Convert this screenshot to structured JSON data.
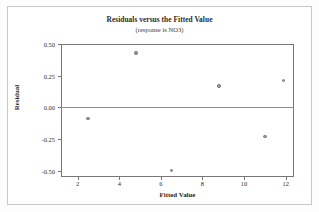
{
  "chart_data": {
    "type": "scatter",
    "title": "Residuals versus the Fitted Value",
    "subtitle": "(response is NO3)",
    "xlabel": "Fitted Value",
    "ylabel": "Residual",
    "xlim": [
      1.2,
      12.4
    ],
    "ylim": [
      -0.55,
      0.5
    ],
    "grid": false,
    "legend": null,
    "reference_line": {
      "axis": "y",
      "value": 0.0,
      "label": "zero-residual-line"
    },
    "x_ticks": [
      {
        "value": 2,
        "label": "2"
      },
      {
        "value": 4,
        "label": "4"
      },
      {
        "value": 6,
        "label": "6"
      },
      {
        "value": 8,
        "label": "8"
      },
      {
        "value": 10,
        "label": "10"
      },
      {
        "value": 12,
        "label": "12"
      }
    ],
    "y_ticks": [
      {
        "value": 0.5,
        "label": "0.50"
      },
      {
        "value": 0.25,
        "label": "0.25"
      },
      {
        "value": 0.0,
        "label": "0.00"
      },
      {
        "value": -0.25,
        "label": "-0.25"
      },
      {
        "value": -0.5,
        "label": "-0.50"
      }
    ],
    "points": [
      {
        "x": 2.5,
        "y": -0.09
      },
      {
        "x": 4.8,
        "y": 0.43
      },
      {
        "x": 6.5,
        "y": -0.5
      },
      {
        "x": 8.8,
        "y": 0.17
      },
      {
        "x": 11.0,
        "y": -0.23
      },
      {
        "x": 11.9,
        "y": 0.21
      }
    ],
    "colors": {
      "point_fill": "#9a9a9a",
      "point_edge": "#6f6f6f",
      "axis": "#777777",
      "reference_line": "#8a8a8a",
      "text": "#2b2b2b",
      "background": "#ffffff",
      "frame": "#c8c8c8"
    }
  }
}
